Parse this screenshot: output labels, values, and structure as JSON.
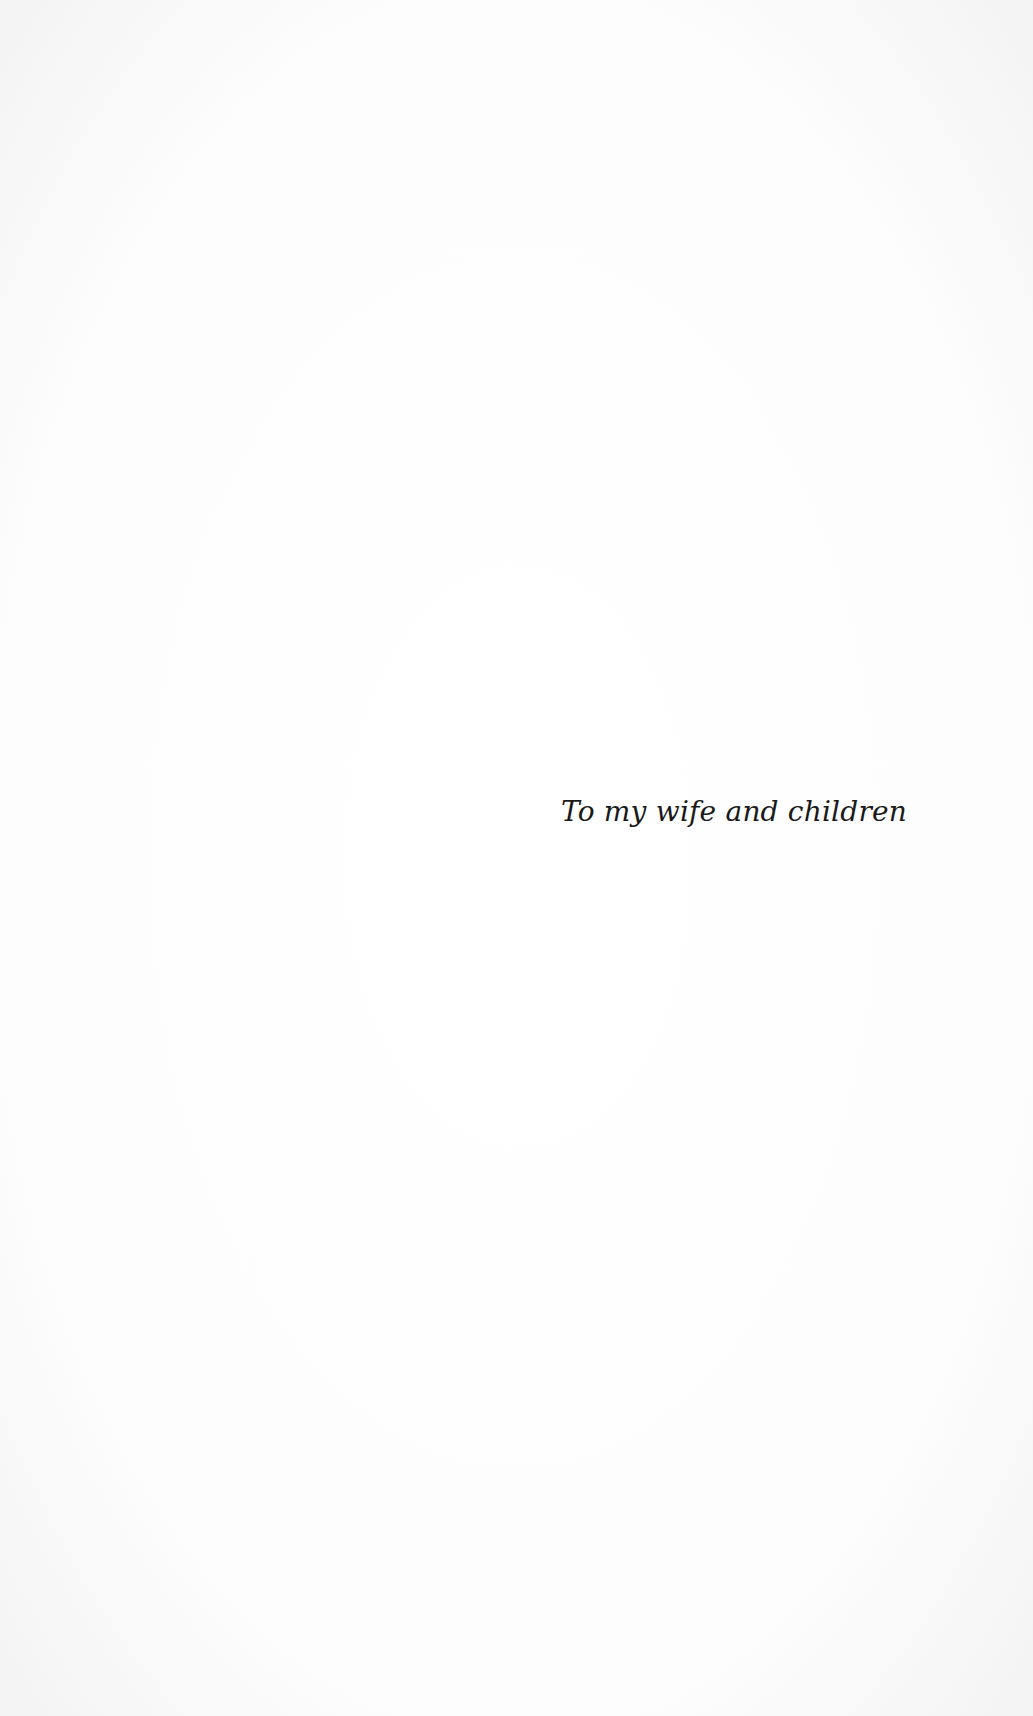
{
  "page": {
    "dedication": "To my wife and children"
  }
}
